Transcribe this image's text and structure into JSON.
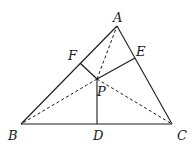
{
  "diagram": {
    "type": "geometry",
    "points": {
      "A": {
        "x": 117,
        "y": 26,
        "label": "A"
      },
      "B": {
        "x": 21,
        "y": 124,
        "label": "B"
      },
      "C": {
        "x": 172,
        "y": 124,
        "label": "C"
      },
      "D": {
        "x": 97,
        "y": 124,
        "label": "D"
      },
      "E": {
        "x": 135,
        "y": 58,
        "label": "E"
      },
      "F": {
        "x": 80,
        "y": 63,
        "label": "F"
      },
      "P": {
        "x": 97,
        "y": 79,
        "label": "P"
      }
    },
    "solid_segments": [
      [
        "A",
        "B"
      ],
      [
        "B",
        "C"
      ],
      [
        "C",
        "A"
      ],
      [
        "P",
        "D"
      ],
      [
        "P",
        "E"
      ],
      [
        "P",
        "F"
      ]
    ],
    "dashed_segments": [
      [
        "P",
        "A"
      ],
      [
        "P",
        "B"
      ],
      [
        "P",
        "C"
      ]
    ],
    "line_color": "#1a1a1a"
  }
}
